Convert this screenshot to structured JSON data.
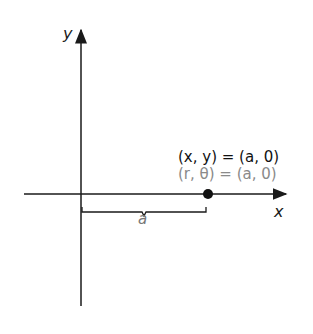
{
  "diagram": {
    "axes": {
      "x_label": "x",
      "y_label": "y"
    },
    "point": {
      "rect_label": "(x, y) = (a, 0)",
      "polar_label": "(r, θ) = (a, 0)"
    },
    "brace_label": "a",
    "colors": {
      "axis": "#1a1a1a",
      "rect_text": "#111111",
      "polar_text": "#8a8a8a",
      "brace_text": "#777777"
    }
  }
}
